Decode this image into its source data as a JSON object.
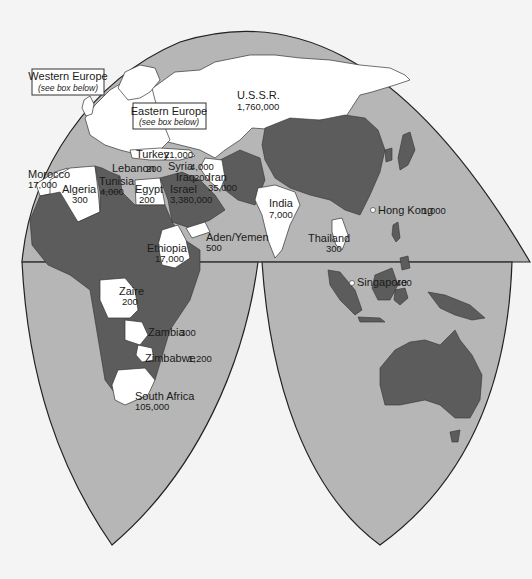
{
  "map": {
    "projection": "interrupted-world",
    "colors": {
      "ocean": "#b6b6b6",
      "highlighted_land": "#ffffff",
      "other_land": "#5c5c5c",
      "background": "#f4f4f4"
    },
    "callouts": [
      {
        "title": "Western Europe",
        "note": "(see box below)"
      },
      {
        "title": "Eastern Europe",
        "note": "(see box below)"
      }
    ],
    "countries": [
      {
        "name": "U.S.S.R.",
        "value": "1,760,000"
      },
      {
        "name": "Turkey",
        "value": "21,000"
      },
      {
        "name": "Lebanon",
        "value": "200"
      },
      {
        "name": "Syria",
        "value": "4,000"
      },
      {
        "name": "Iraq",
        "value": "200"
      },
      {
        "name": "Iran",
        "value": "35,000"
      },
      {
        "name": "Morocco",
        "value": "17,000"
      },
      {
        "name": "Algeria",
        "value": "300"
      },
      {
        "name": "Tunisia",
        "value": "4,000"
      },
      {
        "name": "Egypt",
        "value": "200"
      },
      {
        "name": "Israel",
        "value": "3,380,000"
      },
      {
        "name": "Aden/Yemen",
        "value": "500"
      },
      {
        "name": "Ethiopia",
        "value": "17,000"
      },
      {
        "name": "India",
        "value": "7,000"
      },
      {
        "name": "Hong Kong",
        "value": "1,000"
      },
      {
        "name": "Thailand",
        "value": "300"
      },
      {
        "name": "Singapore",
        "value": "400"
      },
      {
        "name": "Zaire",
        "value": "200"
      },
      {
        "name": "Zambia",
        "value": "300"
      },
      {
        "name": "Zimbabwe",
        "value": "1,200"
      },
      {
        "name": "South Africa",
        "value": "105,000"
      }
    ]
  }
}
